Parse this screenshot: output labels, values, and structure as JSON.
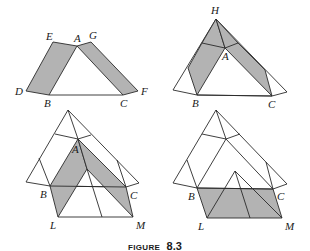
{
  "figure": {
    "caption_word": "FIGURE",
    "caption_number": "8.3",
    "panels": [
      {
        "id": "top-left",
        "labels": [
          "E",
          "A",
          "G",
          "D",
          "B",
          "C",
          "F"
        ]
      },
      {
        "id": "top-right",
        "labels": [
          "H",
          "A",
          "B",
          "C"
        ]
      },
      {
        "id": "bottom-left",
        "labels": [
          "A",
          "B",
          "C",
          "L",
          "M"
        ]
      },
      {
        "id": "bottom-right",
        "labels": [
          "B",
          "C",
          "L",
          "M"
        ]
      }
    ]
  },
  "labels": {
    "p1": {
      "E": "E",
      "A": "A",
      "G": "G",
      "D": "D",
      "B": "B",
      "C": "C",
      "F": "F"
    },
    "p2": {
      "H": "H",
      "A": "A",
      "B": "B",
      "C": "C"
    },
    "p3": {
      "A": "A",
      "B": "B",
      "C": "C",
      "L": "L",
      "M": "M"
    },
    "p4": {
      "B": "B",
      "C": "C",
      "L": "L",
      "M": "M"
    }
  },
  "colors": {
    "shade": "#b3b3b3",
    "line": "#2a2a2a"
  }
}
